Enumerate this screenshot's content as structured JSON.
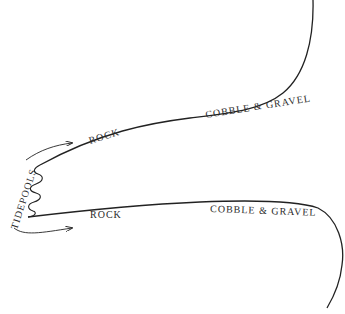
{
  "diagram": {
    "type": "coastline-zones",
    "colors": {
      "line": "#222222",
      "text": "#2a2a2a",
      "background": "#ffffff"
    },
    "labels": {
      "tidepools": "TIDEPOOLS",
      "upper_rock": "ROCK",
      "upper_cobble": "COBBLE & GRAVEL",
      "lower_rock": "ROCK",
      "lower_cobble": "COBBLE & GRAVEL"
    }
  }
}
